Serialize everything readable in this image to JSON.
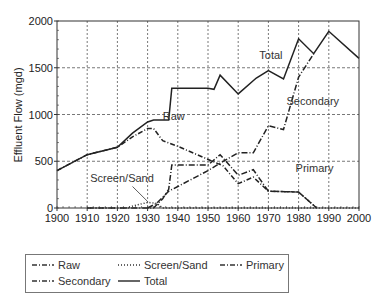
{
  "chart_data": {
    "type": "line",
    "title": "",
    "xlabel": "",
    "ylabel": "Effluent Flow (mgd)",
    "xlim": [
      1900,
      2000
    ],
    "ylim": [
      0,
      2000
    ],
    "x_ticks": [
      1900,
      1910,
      1920,
      1930,
      1940,
      1950,
      1960,
      1970,
      1980,
      1990,
      2000
    ],
    "y_ticks": [
      0,
      500,
      1000,
      1500,
      2000
    ],
    "grid": true,
    "legend_position": "bottom",
    "series": [
      {
        "name": "Raw",
        "style": "dashed-dot",
        "points": [
          [
            1900,
            400
          ],
          [
            1910,
            570
          ],
          [
            1920,
            650
          ],
          [
            1925,
            760
          ],
          [
            1930,
            850
          ],
          [
            1932,
            850
          ],
          [
            1935,
            720
          ],
          [
            1940,
            660
          ],
          [
            1955,
            450
          ],
          [
            1960,
            260
          ],
          [
            1965,
            330
          ],
          [
            1970,
            180
          ],
          [
            1980,
            170
          ],
          [
            1986,
            0
          ]
        ]
      },
      {
        "name": "Screen/Sand",
        "style": "dotted",
        "points": [
          [
            1910,
            0
          ],
          [
            1923,
            0
          ],
          [
            1925,
            20
          ],
          [
            1930,
            60
          ],
          [
            1933,
            50
          ],
          [
            1935,
            0
          ],
          [
            2000,
            0
          ]
        ]
      },
      {
        "name": "Primary",
        "style": "dash-dot",
        "points": [
          [
            1910,
            0
          ],
          [
            1932,
            0
          ],
          [
            1935,
            100
          ],
          [
            1937,
            200
          ],
          [
            1938,
            460
          ],
          [
            1950,
            460
          ],
          [
            1954,
            570
          ],
          [
            1960,
            350
          ],
          [
            1965,
            410
          ],
          [
            1970,
            180
          ],
          [
            1980,
            170
          ],
          [
            1986,
            0
          ]
        ]
      },
      {
        "name": "Secondary",
        "style": "dash-dot",
        "points": [
          [
            1930,
            0
          ],
          [
            1933,
            50
          ],
          [
            1937,
            180
          ],
          [
            1940,
            230
          ],
          [
            1950,
            400
          ],
          [
            1955,
            500
          ],
          [
            1960,
            590
          ],
          [
            1965,
            590
          ],
          [
            1970,
            880
          ],
          [
            1975,
            840
          ],
          [
            1980,
            1400
          ],
          [
            1985,
            1650
          ]
        ]
      },
      {
        "name": "Total",
        "style": "solid",
        "points": [
          [
            1900,
            400
          ],
          [
            1910,
            570
          ],
          [
            1920,
            650
          ],
          [
            1925,
            800
          ],
          [
            1930,
            920
          ],
          [
            1932,
            940
          ],
          [
            1937,
            940
          ],
          [
            1938,
            1280
          ],
          [
            1950,
            1280
          ],
          [
            1952,
            1270
          ],
          [
            1954,
            1420
          ],
          [
            1960,
            1220
          ],
          [
            1966,
            1390
          ],
          [
            1970,
            1470
          ],
          [
            1975,
            1380
          ],
          [
            1980,
            1810
          ],
          [
            1985,
            1650
          ],
          [
            1990,
            1890
          ],
          [
            2000,
            1600
          ]
        ]
      }
    ],
    "annotations": [
      {
        "text": "Total",
        "x": 1967,
        "y": 1590
      },
      {
        "text": "Secondary",
        "x": 1976,
        "y": 1100
      },
      {
        "text": "Raw",
        "x": 1935,
        "y": 940
      },
      {
        "text": "Primary",
        "x": 1979,
        "y": 390
      },
      {
        "text": "Screen/Sand",
        "x": 1911,
        "y": 280
      }
    ]
  },
  "legend": {
    "items": [
      {
        "label": "Raw"
      },
      {
        "label": "Screen/Sand"
      },
      {
        "label": "Primary"
      },
      {
        "label": "Secondary"
      },
      {
        "label": "Total"
      }
    ]
  }
}
